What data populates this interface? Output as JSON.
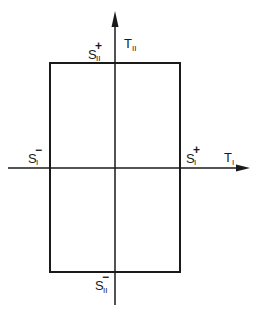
{
  "diagram": {
    "type": "yield-surface-rectangle",
    "axes": {
      "horizontal": {
        "symbol": "T",
        "subscript": "I"
      },
      "vertical": {
        "symbol": "T",
        "subscript": "II"
      }
    },
    "labels": {
      "s1_minus": {
        "symbol": "S",
        "subscript": "I",
        "superscript": "−"
      },
      "s1_plus": {
        "symbol": "S",
        "subscript": "I",
        "superscript": "+"
      },
      "s2_plus": {
        "symbol": "S",
        "subscript": "II",
        "superscript": "+"
      },
      "s2_minus": {
        "symbol": "S",
        "subscript": "II",
        "superscript": "−"
      }
    },
    "colors": {
      "ink": "#1a1a1a",
      "background": "#ffffff"
    }
  }
}
